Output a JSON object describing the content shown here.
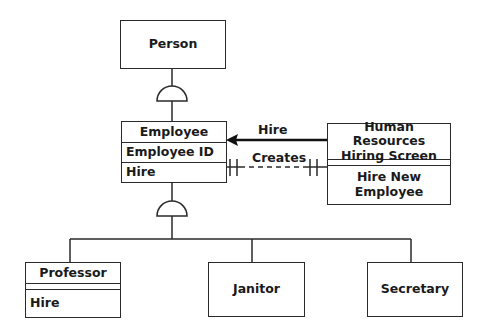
{
  "diagram": {
    "type": "class-diagram",
    "classes": {
      "person": {
        "name": "Person"
      },
      "employee": {
        "name": "Employee",
        "attribute": "Employee ID",
        "operation": "Hire"
      },
      "hr_screen": {
        "name_line1": "Human Resources",
        "name_line2": "Hiring Screen",
        "operation_line1": "Hire New",
        "operation_line2": "Employee"
      },
      "professor": {
        "name": "Professor",
        "operation": "Hire"
      },
      "janitor": {
        "name": "Janitor"
      },
      "secretary": {
        "name": "Secretary"
      }
    },
    "relationships": {
      "hire_message": {
        "label": "Hire",
        "from": "Human Resources Hiring Screen",
        "to": "Employee",
        "style": "solid-arrow"
      },
      "creates": {
        "label": "Creates",
        "from": "Human Resources Hiring Screen",
        "to": "Employee",
        "style": "dashed",
        "multiplicity": "one-to-one"
      },
      "person_generalization": {
        "parent": "Person",
        "child": "Employee",
        "style": "semicircle"
      },
      "employee_generalization": {
        "parent": "Employee",
        "children": [
          "Professor",
          "Janitor",
          "Secretary"
        ],
        "style": "semicircle"
      }
    }
  },
  "colors": {
    "line": "#2a2a2a",
    "background": "#ffffff"
  }
}
